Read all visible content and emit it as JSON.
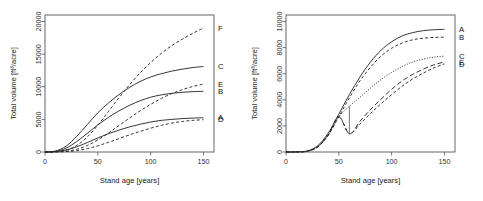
{
  "figure": {
    "panels": [
      "left",
      "right"
    ],
    "background": "#ffffff",
    "line_color": "#2b2b2b"
  },
  "chart_data": [
    {
      "type": "line",
      "panel": "left",
      "title": "",
      "xlabel": "Stand age [years]",
      "ylabel": "Total volume [ft³/acre]",
      "xlim": [
        0,
        160
      ],
      "ylim": [
        0,
        21000
      ],
      "xticks": [
        0,
        50,
        100,
        150
      ],
      "yticks": [
        0,
        5000,
        10000,
        15000,
        20000
      ],
      "xticklabels": [
        "0",
        "50",
        "100",
        "150"
      ],
      "yticklabels": [
        "0",
        "5000",
        "10000",
        "15000",
        "20000"
      ],
      "grid": false,
      "legend": "curve-end-labels",
      "x": [
        0,
        10,
        20,
        30,
        40,
        50,
        60,
        70,
        80,
        90,
        100,
        110,
        120,
        130,
        140,
        150
      ],
      "series": [
        {
          "name": "F",
          "style": "dashed",
          "label": "F",
          "label_y": 19000,
          "values": [
            0,
            60,
            300,
            1000,
            2300,
            4100,
            6200,
            8300,
            10300,
            12100,
            13700,
            15100,
            16300,
            17300,
            18200,
            19000
          ]
        },
        {
          "name": "C",
          "style": "solid",
          "label": "C",
          "label_y": 13100,
          "values": [
            0,
            150,
            900,
            2400,
            4200,
            6000,
            7500,
            8800,
            9900,
            10800,
            11500,
            12000,
            12400,
            12700,
            12950,
            13100
          ]
        },
        {
          "name": "E",
          "style": "dashed",
          "label": "E",
          "label_y": 10400,
          "values": [
            0,
            20,
            120,
            420,
            1000,
            1850,
            2900,
            4050,
            5200,
            6300,
            7300,
            8200,
            8950,
            9550,
            10050,
            10400
          ]
        },
        {
          "name": "B",
          "style": "solid",
          "label": "B",
          "label_y": 9300,
          "values": [
            0,
            100,
            600,
            1600,
            2850,
            4150,
            5300,
            6300,
            7150,
            7850,
            8400,
            8750,
            9000,
            9150,
            9250,
            9300
          ]
        },
        {
          "name": "A",
          "style": "solid",
          "label": "A",
          "label_y": 5250,
          "values": [
            0,
            50,
            300,
            800,
            1450,
            2150,
            2800,
            3350,
            3850,
            4250,
            4600,
            4850,
            5000,
            5120,
            5200,
            5250
          ]
        },
        {
          "name": "D",
          "style": "dashed",
          "label": "D",
          "label_y": 4950,
          "values": [
            0,
            10,
            60,
            210,
            520,
            950,
            1480,
            2050,
            2620,
            3150,
            3650,
            4080,
            4430,
            4680,
            4850,
            4950
          ]
        }
      ]
    },
    {
      "type": "line",
      "panel": "right",
      "title": "",
      "xlabel": "Stand age [years]",
      "ylabel": "Total volume [ft³/acre]",
      "xlim": [
        0,
        160
      ],
      "ylim": [
        0,
        10500
      ],
      "xticks": [
        0,
        50,
        100,
        150
      ],
      "yticks": [
        0,
        2000,
        4000,
        6000,
        8000,
        10000
      ],
      "xticklabels": [
        "0",
        "50",
        "100",
        "150"
      ],
      "yticklabels": [
        "0",
        "2000",
        "4000",
        "6000",
        "8000",
        "10000"
      ],
      "grid": false,
      "legend": "curve-end-labels",
      "thinning_event": {
        "age": 60,
        "volume_before": 3500,
        "volume_after": 1400,
        "description": "vertical drop at stand age 60"
      },
      "x": [
        0,
        10,
        20,
        30,
        40,
        50,
        60,
        70,
        80,
        90,
        100,
        110,
        120,
        130,
        140,
        150
      ],
      "series": [
        {
          "name": "A",
          "style": "solid",
          "label": "A",
          "label_y": 9400,
          "values": [
            0,
            10,
            80,
            480,
            1450,
            2900,
            4400,
            5750,
            6900,
            7800,
            8450,
            8900,
            9150,
            9300,
            9370,
            9400
          ]
        },
        {
          "name": "B",
          "style": "dashed",
          "label": "B",
          "label_y": 8800,
          "values": [
            0,
            8,
            60,
            400,
            1300,
            2700,
            4150,
            5450,
            6500,
            7350,
            7950,
            8350,
            8600,
            8720,
            8780,
            8800
          ]
        },
        {
          "name": "C",
          "style": "dotted",
          "label": "C",
          "label_y": 7350,
          "values": [
            0,
            8,
            60,
            400,
            1300,
            2700,
            3500,
            4200,
            4900,
            5550,
            6100,
            6550,
            6900,
            7120,
            7270,
            7350
          ]
        },
        {
          "name": "E",
          "style": "longdash",
          "label": "E",
          "label_y": 6900,
          "values": [
            0,
            8,
            60,
            400,
            1300,
            2700,
            1400,
            2350,
            3250,
            4050,
            4800,
            5450,
            5950,
            6350,
            6680,
            6900
          ]
        },
        {
          "name": "D",
          "style": "dashed",
          "label": "D",
          "label_y": 6750,
          "values": [
            0,
            8,
            60,
            400,
            1300,
            2700,
            1400,
            2150,
            2950,
            3700,
            4400,
            5050,
            5600,
            6050,
            6450,
            6750
          ]
        }
      ]
    }
  ]
}
